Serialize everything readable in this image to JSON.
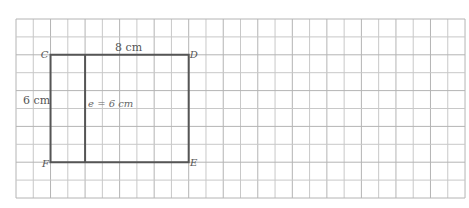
{
  "figure": {
    "type": "rectangle-on-grid",
    "grid": {
      "columns": 26,
      "rows": 10,
      "left": 16,
      "top": 19,
      "cell_width": 17.27,
      "cell_height": 17.9,
      "line_color": "#c8c8c8",
      "major_line_color": "#b4b4b4"
    },
    "rectangle": {
      "vertices": {
        "C": {
          "col": 2,
          "row": 2
        },
        "D": {
          "col": 10,
          "row": 2
        },
        "E": {
          "col": 10,
          "row": 8
        },
        "F": {
          "col": 2,
          "row": 8
        }
      },
      "stroke_color": "#555555"
    },
    "inner_segment": {
      "col": 4,
      "row_start": 2,
      "row_end": 8
    },
    "labels": {
      "vertex_c": "C",
      "vertex_d": "D",
      "vertex_e": "E",
      "vertex_f": "F",
      "top_side": "8 cm",
      "left_side": "6 cm",
      "inner_segment": "e = 6 cm"
    }
  }
}
